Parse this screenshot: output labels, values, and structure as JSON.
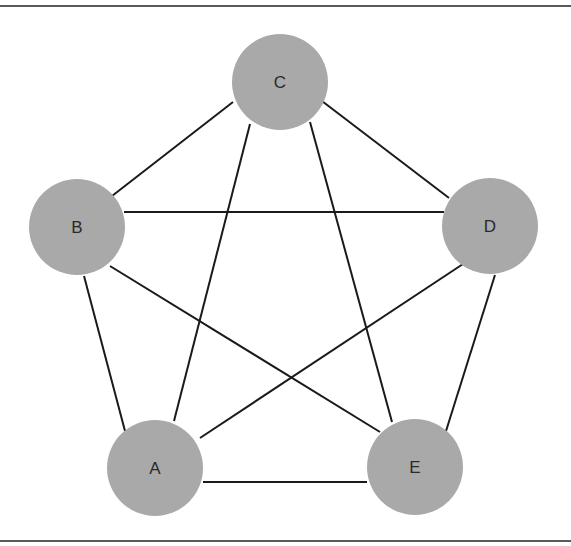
{
  "diagram": {
    "type": "complete-graph",
    "frame": {
      "top_line_y": 5,
      "bottom_line_y": 541,
      "color": "#5a5a5a"
    },
    "style": {
      "node_fill": "#a9a9a9",
      "edge_color": "#1a1a1a",
      "label_color": "#2a2a2a",
      "node_radius": 48
    },
    "nodes": [
      {
        "id": "A",
        "label": "A",
        "cx": 155,
        "cy": 468
      },
      {
        "id": "B",
        "label": "B",
        "cx": 77,
        "cy": 227
      },
      {
        "id": "C",
        "label": "C",
        "cx": 280,
        "cy": 82
      },
      {
        "id": "D",
        "label": "D",
        "cx": 490,
        "cy": 226
      },
      {
        "id": "E",
        "label": "E",
        "cx": 415,
        "cy": 467
      }
    ],
    "edges": [
      {
        "from": "B",
        "to": "C",
        "x1": 112,
        "y1": 196,
        "x2": 233,
        "y2": 102
      },
      {
        "from": "C",
        "to": "D",
        "x1": 318,
        "y1": 98,
        "x2": 449,
        "y2": 198
      },
      {
        "from": "B",
        "to": "D",
        "x1": 124,
        "y1": 212,
        "x2": 444,
        "y2": 212
      },
      {
        "from": "B",
        "to": "E",
        "x1": 110,
        "y1": 266,
        "x2": 380,
        "y2": 432
      },
      {
        "from": "B",
        "to": "A",
        "x1": 84,
        "y1": 276,
        "x2": 125,
        "y2": 431
      },
      {
        "from": "C",
        "to": "A",
        "x1": 250,
        "y1": 124,
        "x2": 174,
        "y2": 421
      },
      {
        "from": "C",
        "to": "E",
        "x1": 310,
        "y1": 122,
        "x2": 392,
        "y2": 422
      },
      {
        "from": "D",
        "to": "A",
        "x1": 463,
        "y1": 264,
        "x2": 200,
        "y2": 438
      },
      {
        "from": "D",
        "to": "E",
        "x1": 495,
        "y1": 275,
        "x2": 446,
        "y2": 431
      },
      {
        "from": "A",
        "to": "E",
        "x1": 203,
        "y1": 482,
        "x2": 367,
        "y2": 482
      }
    ]
  }
}
